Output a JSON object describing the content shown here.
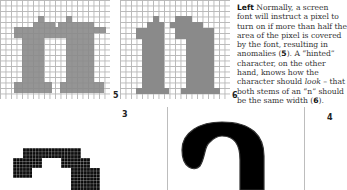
{
  "figures": {
    "fig5_label": "5",
    "fig6_label": "6",
    "fig3_label": "3",
    "fig4_label": "4"
  },
  "caption": {
    "lead": "Left",
    "lines": [
      " Normally, a screen",
      "font will instruct a pixel to",
      "turn on if more than half the",
      "area of the pixel is covered",
      "by the font, resulting in",
      "anomalies (",
      "character, on the other",
      "hand, knows how the",
      "character should ",
      "both stems of an “n” should",
      "be the same width ("
    ],
    "ref5": "5",
    "after5": "). A “hinted”",
    "look": "look",
    "after_look": " – that",
    "ref6": "6",
    "end": ")."
  },
  "colors": {
    "glyph_gray": "#8a8a8a",
    "grid_line": "#b8b8b8",
    "ink": "#000000"
  }
}
